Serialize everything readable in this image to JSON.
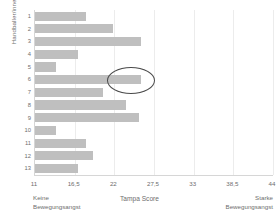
{
  "chart_data": {
    "type": "bar",
    "orientation": "horizontal",
    "title": "",
    "xlabel": "Tampa Score",
    "ylabel": "Handballer/innen",
    "categories": [
      "1",
      "2",
      "3",
      "4",
      "5",
      "6",
      "7",
      "8",
      "9",
      "10",
      "11",
      "12",
      "13"
    ],
    "values": [
      18.1,
      21.8,
      25.7,
      17.0,
      13.9,
      25.7,
      20.4,
      23.6,
      25.4,
      13.9,
      18.1,
      19.0,
      17.0
    ],
    "xlim": [
      11,
      44
    ],
    "xticks": [
      11,
      16.5,
      22,
      27.5,
      33,
      38.5,
      44
    ],
    "xtick_labels": [
      "11",
      "16,5",
      "22",
      "27,5",
      "33",
      "38,5",
      "44"
    ],
    "grid": true,
    "grid_axis": "x",
    "legend": "none",
    "bar_color": "#bfbfbf",
    "annotations": [
      {
        "type": "ellipse",
        "name": "highlight-ellipse",
        "target_series_index": 5,
        "target_category": "6",
        "color": "#4a4a4a"
      }
    ],
    "anchors": {
      "left": "Keine\nBewegungsangst",
      "right": "Starke\nBewegungsangst"
    }
  },
  "axis": {
    "y_title": "Handballer/innen",
    "x_title": "Tampa Score"
  },
  "anchors": {
    "left_label": "Keine\nBewegungsangst",
    "right_label": "Starke\nBewegungsangst"
  }
}
